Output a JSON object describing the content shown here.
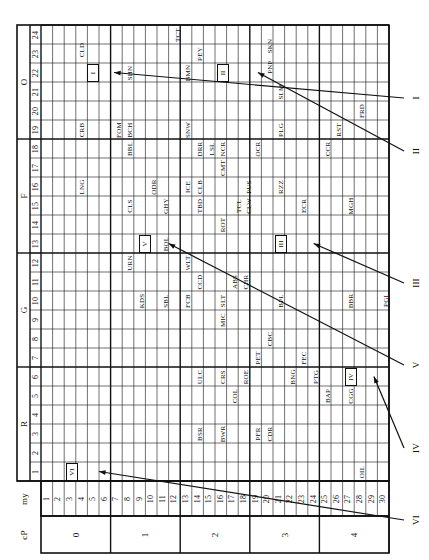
{
  "axes": {
    "row_axis_label": "my",
    "group_axis_label": "cP",
    "row_numbers": [
      "1",
      "2",
      "3",
      "4",
      "5",
      "6",
      "7",
      "8",
      "9",
      "10",
      "11",
      "12",
      "13",
      "14",
      "15",
      "16",
      "17",
      "18",
      "19",
      "20",
      "21",
      "22",
      "23",
      "24",
      "25",
      "26",
      "27",
      "28",
      "29",
      "30"
    ],
    "row_groups": [
      {
        "label": "0",
        "from": 1,
        "to": 6
      },
      {
        "label": "1",
        "from": 7,
        "to": 12
      },
      {
        "label": "2",
        "from": 13,
        "to": 18
      },
      {
        "label": "3",
        "from": 19,
        "to": 24
      },
      {
        "label": "4",
        "from": 25,
        "to": 30
      }
    ],
    "column_numbers": [
      "1",
      "2",
      "3",
      "4",
      "5",
      "6",
      "7",
      "8",
      "9",
      "10",
      "11",
      "12",
      "13",
      "14",
      "15",
      "16",
      "17",
      "18",
      "19",
      "20",
      "21",
      "22",
      "23",
      "24"
    ],
    "column_groups": [
      {
        "label": "R",
        "from": 1,
        "to": 6
      },
      {
        "label": "G",
        "from": 7,
        "to": 12
      },
      {
        "label": "F",
        "from": 13,
        "to": 18
      },
      {
        "label": "O",
        "from": 19,
        "to": 24
      }
    ]
  },
  "entries": [
    {
      "code": "CLD",
      "my": 4,
      "col": 23.2
    },
    {
      "code": "CRB",
      "my": 4,
      "col": 19
    },
    {
      "code": "LNG",
      "my": 4,
      "col": 16
    },
    {
      "code": "FOM",
      "my": 7.2,
      "col": 19
    },
    {
      "code": "BCH",
      "my": 8.2,
      "col": 19
    },
    {
      "code": "BBL",
      "my": 8.2,
      "col": 18
    },
    {
      "code": "SHN",
      "my": 8.2,
      "col": 22
    },
    {
      "code": "CLS",
      "my": 8.2,
      "col": 15
    },
    {
      "code": "URN",
      "my": 8.2,
      "col": 12
    },
    {
      "code": "KDS",
      "my": 9.2,
      "col": 10
    },
    {
      "code": "ODR",
      "my": 10.2,
      "col": 16
    },
    {
      "code": "SBL",
      "my": 11.3,
      "col": 10
    },
    {
      "code": "BOL",
      "my": 11.3,
      "col": 13
    },
    {
      "code": "GHY",
      "my": 11.3,
      "col": 15
    },
    {
      "code": "FCB",
      "my": 13.2,
      "col": 10
    },
    {
      "code": "ICE",
      "my": 13.2,
      "col": 16
    },
    {
      "code": "SNW",
      "my": 13.2,
      "col": 19
    },
    {
      "code": "WLT",
      "my": 13.2,
      "col": 12
    },
    {
      "code": "BMN",
      "my": 13.2,
      "col": 22
    },
    {
      "code": "TCT",
      "my": 12.3,
      "col": 24
    },
    {
      "code": "PEY",
      "my": 14.2,
      "col": 23
    },
    {
      "code": "TBD",
      "my": 14.2,
      "col": 15
    },
    {
      "code": "CLB",
      "my": 14.2,
      "col": 16
    },
    {
      "code": "DRR",
      "my": 14.2,
      "col": 18
    },
    {
      "code": "LSL",
      "my": 15.2,
      "col": 18
    },
    {
      "code": "CCD",
      "my": 14.2,
      "col": 11
    },
    {
      "code": "ULC",
      "my": 14.2,
      "col": 6
    },
    {
      "code": "BSR",
      "my": 14.2,
      "col": 3
    },
    {
      "code": "MIC",
      "my": 16.2,
      "col": 9
    },
    {
      "code": "CMT",
      "my": 16.2,
      "col": 17
    },
    {
      "code": "SLT",
      "my": 16.2,
      "col": 10
    },
    {
      "code": "ROT",
      "my": 16.2,
      "col": 14
    },
    {
      "code": "CRS",
      "my": 16.2,
      "col": 6
    },
    {
      "code": "BWR",
      "my": 16.2,
      "col": 3
    },
    {
      "code": "NCR",
      "my": 16.2,
      "col": 18
    },
    {
      "code": "COL",
      "my": 17.2,
      "col": 5
    },
    {
      "code": "ABS",
      "my": 17.2,
      "col": 11
    },
    {
      "code": "ROE",
      "my": 18.2,
      "col": 6
    },
    {
      "code": "TCL",
      "my": 17.6,
      "col": 15
    },
    {
      "code": "CLW",
      "my": 18.4,
      "col": 15
    },
    {
      "code": "PUS",
      "my": 18.4,
      "col": 16
    },
    {
      "code": "CHR",
      "my": 18.2,
      "col": 11
    },
    {
      "code": "OCR",
      "my": 19.2,
      "col": 18
    },
    {
      "code": "PET",
      "my": 19.2,
      "col": 7
    },
    {
      "code": "PFR",
      "my": 19.2,
      "col": 3
    },
    {
      "code": "CBC",
      "my": 20.2,
      "col": 8
    },
    {
      "code": "CDR",
      "my": 20.2,
      "col": 3
    },
    {
      "code": "BPL",
      "my": 21.2,
      "col": 10
    },
    {
      "code": "PLG",
      "my": 21.2,
      "col": 19
    },
    {
      "code": "RZZ",
      "my": 21.2,
      "col": 16
    },
    {
      "code": "PNP",
      "my": 20.2,
      "col": 22.3
    },
    {
      "code": "SKN",
      "my": 20.2,
      "col": 23.4
    },
    {
      "code": "SLM",
      "my": 21.2,
      "col": 21
    },
    {
      "code": "BNG",
      "my": 22.2,
      "col": 6
    },
    {
      "code": "FEC",
      "my": 23.2,
      "col": 7
    },
    {
      "code": "ECR",
      "my": 23.2,
      "col": 15
    },
    {
      "code": "PTG",
      "my": 24.2,
      "col": 6
    },
    {
      "code": "BAP",
      "my": 25.2,
      "col": 5
    },
    {
      "code": "CCR",
      "my": 25.2,
      "col": 18
    },
    {
      "code": "RST",
      "my": 26.2,
      "col": 19
    },
    {
      "code": "CGG",
      "my": 27.2,
      "col": 5
    },
    {
      "code": "BBR",
      "my": 27.2,
      "col": 10
    },
    {
      "code": "MGH",
      "my": 27.2,
      "col": 15
    },
    {
      "code": "FRD",
      "my": 28.2,
      "col": 20
    },
    {
      "code": "OIL",
      "my": 28.2,
      "col": 1
    },
    {
      "code": "PGI",
      "my": 30.2,
      "col": 10
    }
  ],
  "markers": [
    {
      "label": "I",
      "box_my": 5,
      "box_col": 22,
      "arrow_from_y": 300,
      "tip_my": 6.8,
      "tip_col": 22
    },
    {
      "label": "II",
      "box_my": 16.2,
      "box_col": 22,
      "arrow_from_y": 68,
      "tip_my": 19.2,
      "tip_col": 22
    },
    {
      "label": "III",
      "box_my": 21.2,
      "box_col": 13,
      "arrow_from_y": 0,
      "tip_my": 24,
      "tip_col": 13
    },
    {
      "label": "IV",
      "box_my": 27.2,
      "box_col": 6,
      "arrow_from_y": 0,
      "tip_my": 29.2,
      "tip_col": 6
    },
    {
      "label": "V",
      "box_my": 9.5,
      "box_col": 13,
      "arrow_from_y": 0,
      "tip_my": 11.5,
      "tip_col": 13
    },
    {
      "label": "VI",
      "box_my": 3.2,
      "box_col": 1,
      "arrow_from_y": 0,
      "tip_my": 5.5,
      "tip_col": 1
    }
  ],
  "right_labels": [
    {
      "label": "II",
      "y": 151
    },
    {
      "label": "I",
      "y": 98
    },
    {
      "label": "III",
      "y": 283
    },
    {
      "label": "V",
      "y": 365
    },
    {
      "label": "IV",
      "y": 448
    },
    {
      "label": "VI",
      "y": 520
    }
  ]
}
